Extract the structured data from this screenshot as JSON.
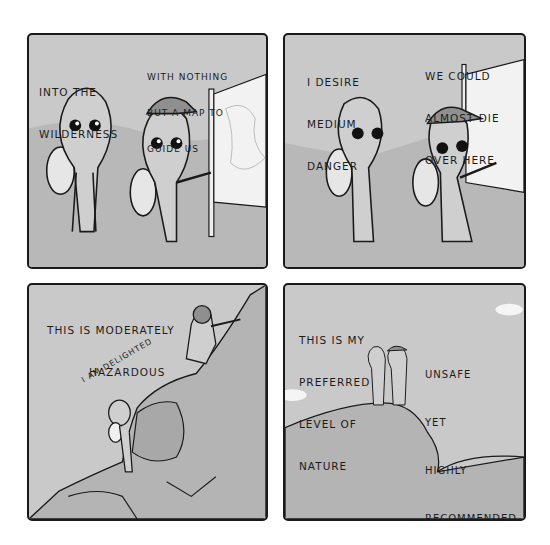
{
  "comic": {
    "layout": "2x2 grid",
    "panels": [
      {
        "id": 1,
        "scene": "Two aliens with backpacks stand before a map on a signpost; capped alien points at map",
        "captions": [
          {
            "lines": [
              "INTO THE",
              "WILDERNESS"
            ]
          },
          {
            "lines": [
              "WITH NOTHING",
              "BUT A MAP TO",
              "GUIDE US"
            ]
          }
        ]
      },
      {
        "id": 2,
        "scene": "Two aliens walking past the map, capped alien pointing back",
        "captions": [
          {
            "lines": [
              "I DESIRE",
              "MEDIUM",
              "DANGER"
            ]
          },
          {
            "lines": [
              "WE COULD",
              "ALMOST DIE",
              "OVER HERE"
            ]
          }
        ]
      },
      {
        "id": 3,
        "scene": "Aliens climbing a rocky cliff",
        "captions": [
          {
            "lines": [
              "THIS IS MODERATELY",
              "HAZARDOUS"
            ]
          },
          {
            "lines": [
              "I AM DELIGHTED"
            ],
            "style": "curved around alien head"
          }
        ]
      },
      {
        "id": 4,
        "scene": "Two tiny aliens standing on a hilltop with clouds",
        "captions": [
          {
            "lines": [
              "THIS IS MY",
              "PREFERRED",
              "LEVEL OF",
              "NATURE"
            ]
          },
          {
            "lines": [
              "UNSAFE",
              "YET",
              "HIGHLY",
              "RECOMMENDED"
            ]
          }
        ]
      }
    ]
  },
  "colors": {
    "panel_bg": "#c9c9c9",
    "ink": "#1a1a1a",
    "hill": "#b4b4b4",
    "alien_skin": "#cfcfcf",
    "cap": "#8f8f8f",
    "map": "#f2f2f2"
  }
}
